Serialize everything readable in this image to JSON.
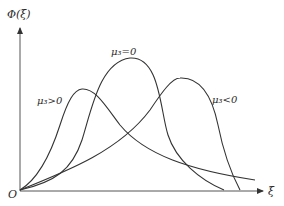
{
  "figure": {
    "y_axis_label": "Φ(ξ)",
    "x_axis_label": "ξ",
    "origin_label": "O",
    "line_color": "#333333",
    "background": "#ffffff"
  },
  "curves": [
    {
      "id": "positive-skew",
      "label": "μ₃>0",
      "description": "peak left, long right tail"
    },
    {
      "id": "zero-skew",
      "label": "μ₃=0",
      "description": "symmetric, tallest peak in middle"
    },
    {
      "id": "negative-skew",
      "label": "μ₃<0",
      "description": "peak right, long left tail"
    }
  ]
}
